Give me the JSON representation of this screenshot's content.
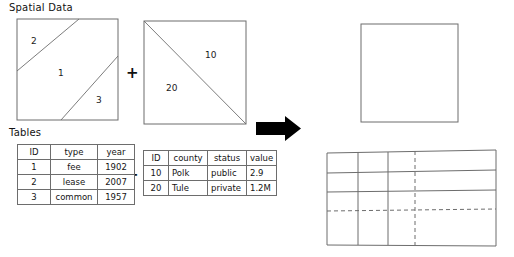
{
  "labels": {
    "spatial": "Spatial Data",
    "tables": "Tables",
    "plus_spatial": "+",
    "plus_tables": "+"
  },
  "spatial": {
    "parcel_square": {
      "name": "parcel-polygons",
      "region_labels": [
        "2",
        "1",
        "3"
      ]
    },
    "county_square": {
      "name": "county-polygons",
      "region_labels": [
        "10",
        "20"
      ]
    },
    "result_square": {
      "name": "overlay-result",
      "region_labels": []
    }
  },
  "tables": {
    "parcels": {
      "headers": [
        "ID",
        "type",
        "year"
      ],
      "rows": [
        [
          "1",
          "fee",
          "1902"
        ],
        [
          "2",
          "lease",
          "2007"
        ],
        [
          "3",
          "common",
          "1957"
        ]
      ]
    },
    "counties": {
      "headers": [
        "ID",
        "county",
        "status",
        "value"
      ],
      "rows": [
        [
          "10",
          "Polk",
          "public",
          "2.9"
        ],
        [
          "20",
          "Tule",
          "private",
          "1.2M"
        ]
      ]
    },
    "result": {
      "headers": [
        "",
        "",
        "",
        ""
      ],
      "rows": [
        [
          "",
          "",
          "",
          ""
        ],
        [
          "",
          "",
          "",
          ""
        ],
        [
          "",
          "",
          "",
          ""
        ]
      ]
    }
  },
  "arrow": {
    "name": "process-arrow",
    "direction": "right"
  },
  "colors": {
    "ink": "#141414",
    "line": "#6d6d6d",
    "arrow": "#000000",
    "background": "#ffffff"
  }
}
